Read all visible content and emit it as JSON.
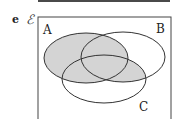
{
  "figure": {
    "part_label": "e",
    "universe_symbol": "ℰ",
    "sets": [
      {
        "name": "A",
        "label": "A"
      },
      {
        "name": "B",
        "label": "B"
      },
      {
        "name": "C",
        "label": "C"
      }
    ],
    "shaded_region": "A ∪ (B ∩ C)",
    "shade_color": "#d4d4d4",
    "stroke_color": "#333333"
  }
}
